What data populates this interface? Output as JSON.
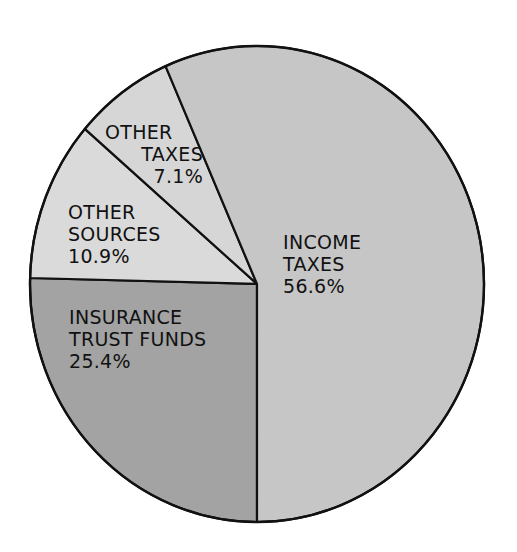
{
  "chart_data": {
    "type": "pie",
    "title": "",
    "start_angle_deg": 90,
    "direction": "clockwise",
    "center": [
      257,
      284
    ],
    "radius_x": 227,
    "radius_y": 238,
    "slices": [
      {
        "name": "Insurance Trust Funds",
        "label_lines": [
          "INSURANCE",
          "TRUST FUNDS"
        ],
        "value": 25.4,
        "value_label": "25.4%",
        "color": "#a3a3a3"
      },
      {
        "name": "Other Sources",
        "label_lines": [
          "OTHER",
          "SOURCES"
        ],
        "value": 10.9,
        "value_label": "10.9%",
        "color": "#dadada"
      },
      {
        "name": "Other Taxes",
        "label_lines": [
          "OTHER",
          "TAXES"
        ],
        "value": 7.1,
        "value_label": "7.1%",
        "color": "#d6d6d6"
      },
      {
        "name": "Income Taxes",
        "label_lines": [
          "INCOME",
          "TAXES"
        ],
        "value": 56.6,
        "value_label": "56.6%",
        "color": "#c6c6c6"
      }
    ],
    "legend": "none (labels placed inside slices)"
  },
  "labels": {
    "income_taxes": {
      "line1": "INCOME",
      "line2": "TAXES",
      "value": "56.6%"
    },
    "insurance_trust_funds": {
      "line1": "INSURANCE",
      "line2": "TRUST FUNDS",
      "value": "25.4%"
    },
    "other_sources": {
      "line1": "OTHER",
      "line2": "SOURCES",
      "value": "10.9%"
    },
    "other_taxes": {
      "line1": "OTHER",
      "line2": "TAXES",
      "value": "7.1%"
    }
  }
}
